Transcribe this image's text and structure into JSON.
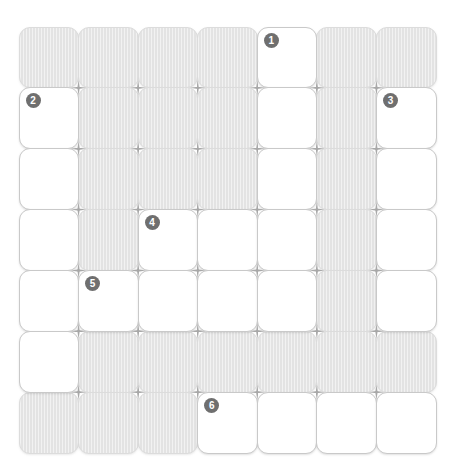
{
  "puzzle": {
    "title": "Crossword Puzzle Grid",
    "rows": 7,
    "columns": 7,
    "cell_states": [
      [
        "block",
        "block",
        "block",
        "block",
        "open",
        "block",
        "block"
      ],
      [
        "open",
        "block",
        "block",
        "block",
        "open",
        "block",
        "open"
      ],
      [
        "open",
        "block",
        "block",
        "block",
        "open",
        "block",
        "open"
      ],
      [
        "open",
        "block",
        "open",
        "open",
        "open",
        "block",
        "open"
      ],
      [
        "open",
        "open",
        "open",
        "open",
        "open",
        "block",
        "open"
      ],
      [
        "open",
        "block",
        "block",
        "block",
        "block",
        "block",
        "block"
      ],
      [
        "block",
        "block",
        "block",
        "open",
        "open",
        "open",
        "open"
      ]
    ],
    "clue_numbers": [
      {
        "number": "1",
        "row": 0,
        "col": 4
      },
      {
        "number": "2",
        "row": 1,
        "col": 0
      },
      {
        "number": "3",
        "row": 1,
        "col": 6
      },
      {
        "number": "4",
        "row": 3,
        "col": 2
      },
      {
        "number": "5",
        "row": 4,
        "col": 1
      },
      {
        "number": "6",
        "row": 6,
        "col": 3
      }
    ],
    "letters": [],
    "colors": {
      "open_cell": "#ffffff",
      "blocked_cell": "#e3e3e3",
      "cell_border": "#c9c9c9",
      "blocked_border": "#dcdcdc",
      "badge_background": "#6f6f6f",
      "badge_text": "#ffffff",
      "junction_mark": "#a8a8a8",
      "page_background": "#ffffff"
    }
  }
}
